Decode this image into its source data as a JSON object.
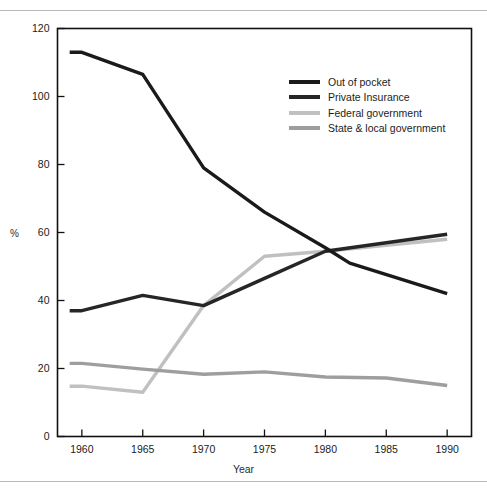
{
  "figure": {
    "background": "#ffffff",
    "rule_color": "#b9b9b9"
  },
  "chart_data": {
    "type": "line",
    "title": "",
    "xlabel": "Year",
    "ylabel": "%",
    "xlim": [
      1958,
      1992
    ],
    "ylim": [
      0,
      120
    ],
    "grid": false,
    "legend_position": "upper-right-inside",
    "x_ticks": [
      1960,
      1965,
      1970,
      1975,
      1980,
      1985,
      1990
    ],
    "y_ticks": [
      0,
      20,
      40,
      60,
      80,
      100,
      120
    ],
    "series": [
      {
        "name": "Out of pocket",
        "color": "#1a1a1a",
        "x": [
          1959,
          1960,
          1965,
          1970,
          1975,
          1980,
          1982,
          1990
        ],
        "values": [
          113,
          113,
          106.5,
          79,
          66,
          55.5,
          51,
          42
        ]
      },
      {
        "name": "Private Insurance",
        "color": "#262626",
        "x": [
          1959,
          1960,
          1965,
          1970,
          1975,
          1980,
          1990
        ],
        "values": [
          37,
          37,
          41.5,
          38.5,
          46.5,
          54.5,
          59.5
        ]
      },
      {
        "name": "Federal government",
        "color": "#c0c0c0",
        "x": [
          1959,
          1960,
          1965,
          1970,
          1975,
          1980,
          1990
        ],
        "values": [
          14.8,
          14.8,
          13,
          38.5,
          53,
          54.5,
          58
        ]
      },
      {
        "name": "State & local government",
        "color": "#9e9e9e",
        "x": [
          1959,
          1960,
          1965,
          1970,
          1975,
          1980,
          1985,
          1990
        ],
        "values": [
          21.5,
          21.5,
          19.8,
          18.3,
          19,
          17.5,
          17.2,
          15
        ]
      }
    ]
  },
  "legend": {
    "items": [
      {
        "label": "Out of pocket",
        "color": "#1a1a1a"
      },
      {
        "label": "Private Insurance",
        "color": "#262626"
      },
      {
        "label": "Federal government",
        "color": "#c0c0c0"
      },
      {
        "label": "State & local government",
        "color": "#9e9e9e"
      }
    ]
  },
  "axis": {
    "y_label": "%",
    "x_label": "Year",
    "y_tick_labels": [
      "0",
      "20",
      "40",
      "60",
      "80",
      "100",
      "120"
    ],
    "x_tick_labels": [
      "1960",
      "1965",
      "1970",
      "1975",
      "1980",
      "1985",
      "1990"
    ]
  }
}
